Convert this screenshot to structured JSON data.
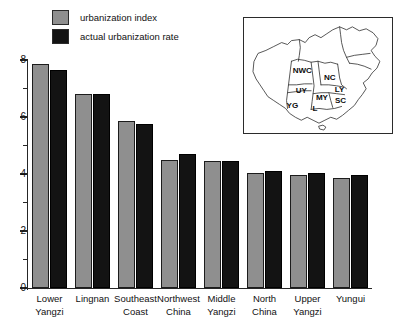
{
  "chart_data": {
    "type": "bar",
    "title": "",
    "xlabel": "",
    "ylabel": "",
    "ylim": [
      0,
      8
    ],
    "grid": false,
    "legend_position": "top-left",
    "categories": [
      "Lower Yangzi",
      "Lingnan",
      "Southeast Coast",
      "Northwest China",
      "Middle Yangzi",
      "North China",
      "Upper Yangzi",
      "Yungui"
    ],
    "category_lines": [
      [
        "Lower",
        "Yangzi"
      ],
      [
        "Lingnan",
        ""
      ],
      [
        "Southeast",
        "Coast"
      ],
      [
        "Northwest",
        "China"
      ],
      [
        "Middle",
        "Yangzi"
      ],
      [
        "North",
        "China"
      ],
      [
        "Upper",
        "Yangzi"
      ],
      [
        "Yungui",
        ""
      ]
    ],
    "series": [
      {
        "name": "urbanization index",
        "color": "#8f8f8f",
        "values": [
          7.85,
          6.8,
          5.85,
          4.5,
          4.45,
          4.05,
          3.95,
          3.85
        ]
      },
      {
        "name": "actual urbanization rate",
        "color": "#131313",
        "values": [
          7.65,
          6.8,
          5.75,
          4.7,
          4.45,
          4.1,
          4.05,
          3.95
        ]
      }
    ],
    "y_major_ticks": [
      0,
      2,
      4,
      6,
      8
    ],
    "y_minor_ticks": [
      1,
      3,
      5,
      7
    ],
    "y_tick_labels": [
      "0",
      "2",
      "4",
      "6",
      "8"
    ]
  },
  "legend": {
    "items": [
      {
        "label": "urbanization index",
        "color": "#8f8f8f"
      },
      {
        "label": "actual urbanization rate",
        "color": "#131313"
      }
    ]
  },
  "map_inset": {
    "codes": [
      {
        "code": "NWC",
        "x": 59,
        "y": 56
      },
      {
        "code": "NC",
        "x": 87,
        "y": 63
      },
      {
        "code": "LY",
        "x": 97,
        "y": 75
      },
      {
        "code": "UY",
        "x": 58,
        "y": 76
      },
      {
        "code": "MY",
        "x": 79,
        "y": 83
      },
      {
        "code": "SC",
        "x": 98,
        "y": 86
      },
      {
        "code": "YG",
        "x": 49,
        "y": 92
      },
      {
        "code": "L",
        "x": 72,
        "y": 95
      }
    ]
  }
}
